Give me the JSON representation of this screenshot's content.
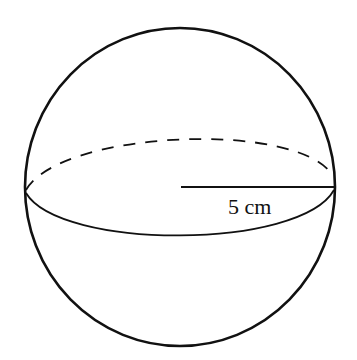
{
  "diagram": {
    "type": "sphere",
    "radius_label": "5 cm",
    "colors": {
      "stroke": "#111111",
      "background": "#ffffff"
    }
  }
}
